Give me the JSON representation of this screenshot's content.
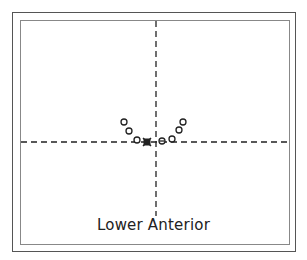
{
  "label": "Lower Anterior",
  "axes": {
    "center": {
      "x": 156,
      "y": 142
    },
    "h_line": {
      "x1": 21,
      "x2": 289
    },
    "v_line": {
      "y1": 21,
      "y2": 218
    }
  },
  "markers": {
    "open_circles": [
      {
        "x": 124,
        "y": 122
      },
      {
        "x": 129,
        "y": 131
      },
      {
        "x": 137,
        "y": 140
      },
      {
        "x": 172,
        "y": 139
      },
      {
        "x": 179,
        "y": 130
      },
      {
        "x": 183,
        "y": 122
      }
    ],
    "filled_marker": {
      "x": 147,
      "y": 142
    },
    "circle_with_bar": {
      "x": 162,
      "y": 141
    }
  },
  "colors": {
    "stroke": "#222222",
    "border_outer": "#555555",
    "border_inner": "#888888"
  }
}
